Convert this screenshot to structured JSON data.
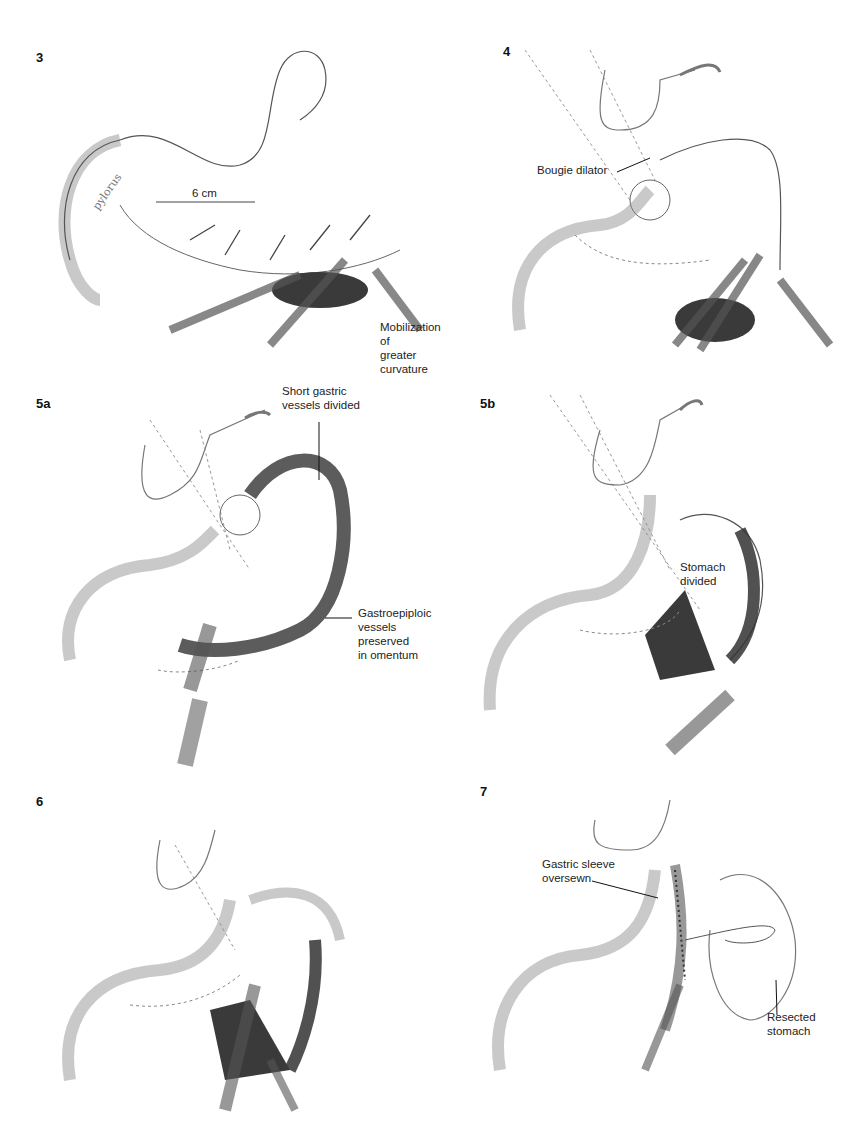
{
  "page": {
    "type": "surgical-illustration-plate",
    "colors": {
      "background": "#ffffff",
      "ink": "#1a1a1a",
      "shading": "#555555",
      "dark_tissue": "#333333"
    }
  },
  "panels": [
    {
      "id": "3",
      "number": "3",
      "annotations": {
        "script_label": "pylorus",
        "measure": "6 cm",
        "caption": "Mobilization of\ngreater curvature"
      }
    },
    {
      "id": "4",
      "number": "4",
      "annotations": {
        "pointer": "Bougie dilator"
      }
    },
    {
      "id": "5a",
      "number": "5a",
      "annotations": {
        "pointer_top": "Short gastric\nvessels divided",
        "pointer_bottom": "Gastroepiploic\nvessels\npreserved\nin omentum"
      }
    },
    {
      "id": "5b",
      "number": "5b",
      "annotations": {
        "pointer": "Stomach\ndivided"
      }
    },
    {
      "id": "6",
      "number": "6",
      "annotations": {}
    },
    {
      "id": "7",
      "number": "7",
      "annotations": {
        "pointer_left": "Gastric sleeve\noversewn",
        "pointer_right": "Resected\nstomach"
      }
    }
  ]
}
